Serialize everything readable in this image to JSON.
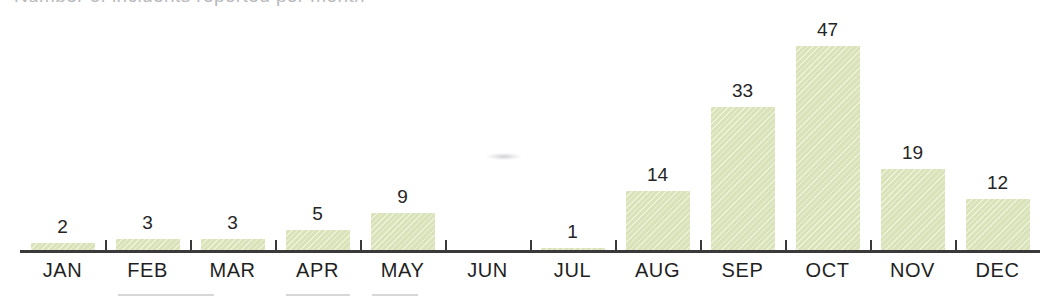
{
  "title_remnant": "Number of incidents reported per month",
  "chart_data": {
    "type": "bar",
    "title": "",
    "xlabel": "",
    "ylabel": "",
    "ylim": [
      0,
      47
    ],
    "grid": false,
    "legend": "none",
    "bar_color": "#dfe7c0",
    "label_color": "#252525",
    "axis_color": "#3a3a3a",
    "categories": [
      "JAN",
      "FEB",
      "MAR",
      "APR",
      "MAY",
      "JUN",
      "JUL",
      "AUG",
      "SEP",
      "OCT",
      "NOV",
      "DEC"
    ],
    "values": [
      2,
      3,
      3,
      5,
      9,
      0,
      1,
      14,
      33,
      47,
      19,
      12
    ],
    "value_labels": [
      "2",
      "3",
      "3",
      "5",
      "9",
      "",
      "1",
      "14",
      "33",
      "47",
      "19",
      "12"
    ]
  }
}
